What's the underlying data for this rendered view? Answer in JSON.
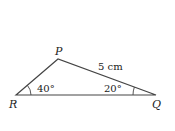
{
  "diagram": {
    "type": "triangle",
    "vertices": {
      "P": {
        "label": "P"
      },
      "Q": {
        "label": "Q"
      },
      "R": {
        "label": "R"
      }
    },
    "side_label": "5 cm",
    "angle_R": "40°",
    "angle_Q": "20°",
    "stroke_color": "#444444"
  }
}
